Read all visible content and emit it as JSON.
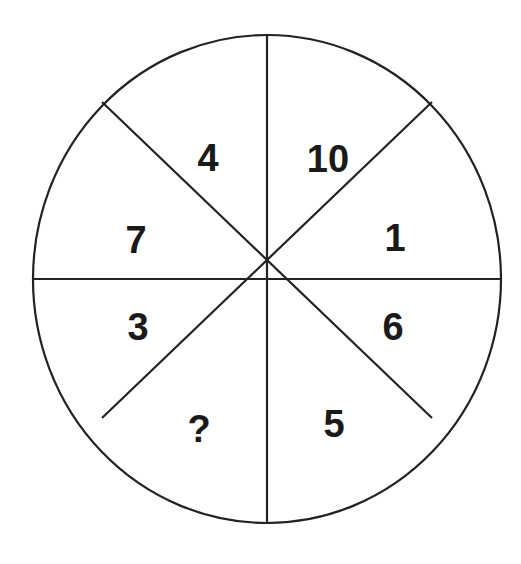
{
  "puzzle": {
    "type": "number-wheel",
    "segments": 8,
    "stroke_color": "#222222",
    "text_color": "#1a1a1a",
    "cells": [
      {
        "position": "top-right",
        "value": "10"
      },
      {
        "position": "right-upper",
        "value": "1"
      },
      {
        "position": "right-lower",
        "value": "6"
      },
      {
        "position": "bottom-right",
        "value": "5"
      },
      {
        "position": "bottom-left",
        "value": "?"
      },
      {
        "position": "left-lower",
        "value": "3"
      },
      {
        "position": "left-upper",
        "value": "7"
      },
      {
        "position": "top-left",
        "value": "4"
      }
    ]
  }
}
